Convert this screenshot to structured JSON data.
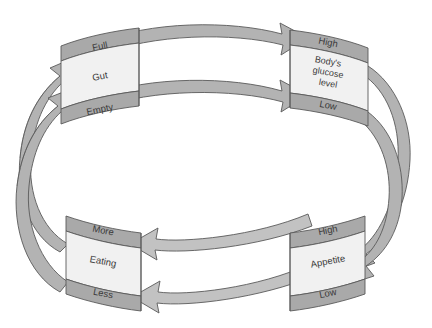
{
  "diagram": {
    "type": "cylindrical-feedback-loop",
    "colors": {
      "band_fill": "#a9a9a9",
      "panel_fill": "#f1f1f1",
      "arrow_fill": "#b0b0b0",
      "arrow_fill_light": "#c4c4c4",
      "outline": "#5a5a5a",
      "text": "#3a3a3a",
      "background": "#ffffff"
    },
    "nodes": [
      {
        "id": "gut",
        "name": "Gut",
        "label": "Gut",
        "position": "top-left",
        "top_band_label": "Full",
        "bottom_band_label": "Empty"
      },
      {
        "id": "glucose",
        "name": "Body's glucose level",
        "label_lines": [
          "Body's",
          "glucose",
          "level"
        ],
        "position": "top-right",
        "top_band_label": "High",
        "bottom_band_label": "Low"
      },
      {
        "id": "eating",
        "name": "Eating",
        "label": "Eating",
        "position": "bottom-left",
        "top_band_label": "More",
        "bottom_band_label": "Less"
      },
      {
        "id": "appetite",
        "name": "Appetite",
        "label": "Appetite",
        "position": "bottom-right",
        "top_band_label": "High",
        "bottom_band_label": "Low"
      }
    ],
    "connections": [
      {
        "id": "gut-full-to-glucose-high",
        "from": "gut",
        "from_state": "Full",
        "to": "glucose",
        "to_state": "High",
        "direction": "right",
        "path": "top-back-upper"
      },
      {
        "id": "gut-empty-to-glucose-low",
        "from": "gut",
        "from_state": "Empty",
        "to": "glucose",
        "to_state": "Low",
        "direction": "right",
        "path": "top-back-lower"
      },
      {
        "id": "glucose-high-to-appetite-low",
        "from": "glucose",
        "from_state": "High",
        "to": "appetite",
        "to_state": "Low",
        "direction": "down-left",
        "path": "right-wrap-upper"
      },
      {
        "id": "glucose-low-to-appetite-high",
        "from": "glucose",
        "from_state": "Low",
        "to": "appetite",
        "to_state": "High",
        "direction": "down-left",
        "path": "right-wrap-lower"
      },
      {
        "id": "appetite-high-to-eating-more",
        "from": "appetite",
        "from_state": "High",
        "to": "eating",
        "to_state": "More",
        "direction": "left",
        "path": "bottom-front-upper"
      },
      {
        "id": "appetite-low-to-eating-less",
        "from": "appetite",
        "from_state": "Low",
        "to": "eating",
        "to_state": "Less",
        "direction": "left",
        "path": "bottom-front-lower"
      },
      {
        "id": "eating-more-to-gut-full",
        "from": "eating",
        "from_state": "More",
        "to": "gut",
        "to_state": "Full",
        "direction": "up-right",
        "path": "left-wrap-upper"
      },
      {
        "id": "eating-less-to-gut-empty",
        "from": "eating",
        "from_state": "Less",
        "to": "gut",
        "to_state": "Empty",
        "direction": "up-right",
        "path": "left-wrap-lower"
      }
    ]
  }
}
